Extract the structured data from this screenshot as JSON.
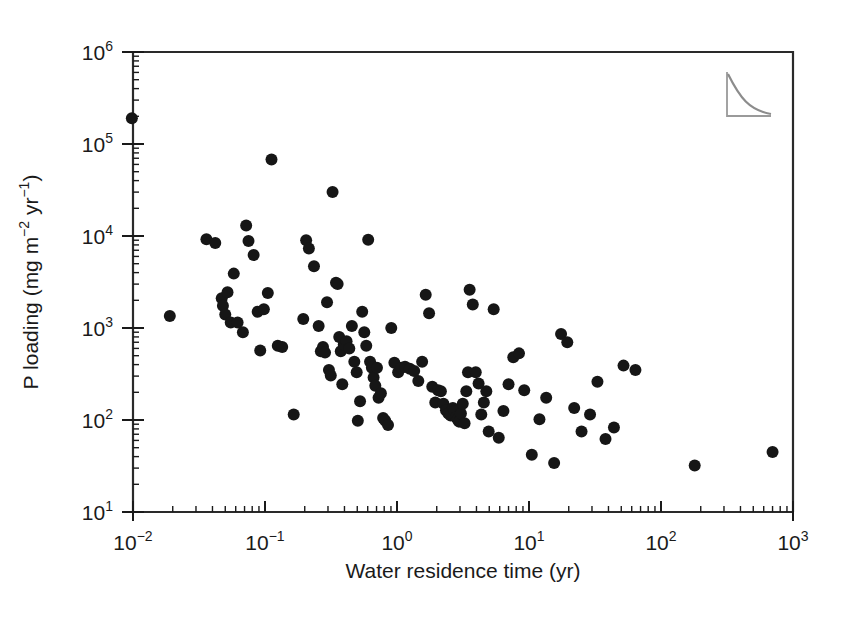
{
  "figure": {
    "background_color": "#ffffff",
    "marker_color": "#161616",
    "axis_color": "#1a1a1a",
    "inset_icon": "decay-curve-icon"
  },
  "chart_data": {
    "type": "scatter",
    "title": "",
    "xlabel": "Water residence time (yr)",
    "ylabel": "P loading (mg m−2 yr−1)",
    "ylabel_parts": {
      "prefix": "P loading (mg m",
      "sup1": "−2",
      "mid": " yr",
      "sup2": "−1",
      "suffix": ")"
    },
    "xscale": "log",
    "yscale": "log",
    "xlim": [
      0.01,
      1000
    ],
    "ylim": [
      10,
      1000000
    ],
    "grid": false,
    "legend": null,
    "xticks": [
      0.01,
      0.1,
      1,
      10,
      100,
      1000
    ],
    "xtick_labels": [
      "10−2",
      "10−1",
      "10⁰",
      "10¹",
      "10²",
      "10³"
    ],
    "xtick_bases": [
      "10",
      "10",
      "10",
      "10",
      "10",
      "10"
    ],
    "xtick_exponents": [
      "−2",
      "−1",
      "0",
      "1",
      "2",
      "3"
    ],
    "yticks": [
      10,
      100,
      1000,
      10000,
      100000,
      1000000
    ],
    "ytick_labels": [
      "10¹",
      "10²",
      "10³",
      "10⁴",
      "10⁵",
      "10⁶"
    ],
    "ytick_bases": [
      "10",
      "10",
      "10",
      "10",
      "10",
      "10"
    ],
    "ytick_exponents": [
      "1",
      "2",
      "3",
      "4",
      "5",
      "6"
    ],
    "minor_ticks": true,
    "marker": "circle-filled",
    "marker_size_px": 12,
    "n_points": 121,
    "points": [
      [
        0.0098,
        190000
      ],
      [
        0.019,
        1350
      ],
      [
        0.036,
        9200
      ],
      [
        0.042,
        8400
      ],
      [
        0.047,
        2100
      ],
      [
        0.048,
        1750
      ],
      [
        0.05,
        1400
      ],
      [
        0.052,
        2450
      ],
      [
        0.055,
        1150
      ],
      [
        0.058,
        3900
      ],
      [
        0.062,
        1150
      ],
      [
        0.068,
        900
      ],
      [
        0.072,
        13000
      ],
      [
        0.075,
        8800
      ],
      [
        0.082,
        6200
      ],
      [
        0.088,
        1500
      ],
      [
        0.092,
        570
      ],
      [
        0.098,
        1600
      ],
      [
        0.105,
        2400
      ],
      [
        0.112,
        68000
      ],
      [
        0.125,
        640
      ],
      [
        0.135,
        620
      ],
      [
        0.165,
        115
      ],
      [
        0.195,
        1250
      ],
      [
        0.205,
        9000
      ],
      [
        0.215,
        7300
      ],
      [
        0.235,
        4700
      ],
      [
        0.255,
        1050
      ],
      [
        0.265,
        560
      ],
      [
        0.275,
        620
      ],
      [
        0.285,
        540
      ],
      [
        0.295,
        1900
      ],
      [
        0.305,
        350
      ],
      [
        0.315,
        305
      ],
      [
        0.325,
        30000
      ],
      [
        0.345,
        3100
      ],
      [
        0.355,
        3000
      ],
      [
        0.365,
        800
      ],
      [
        0.375,
        560
      ],
      [
        0.385,
        245
      ],
      [
        0.395,
        660
      ],
      [
        0.415,
        720
      ],
      [
        0.435,
        600
      ],
      [
        0.455,
        1050
      ],
      [
        0.475,
        430
      ],
      [
        0.495,
        330
      ],
      [
        0.505,
        98
      ],
      [
        0.525,
        160
      ],
      [
        0.545,
        1500
      ],
      [
        0.565,
        900
      ],
      [
        0.585,
        640
      ],
      [
        0.605,
        9100
      ],
      [
        0.625,
        430
      ],
      [
        0.645,
        370
      ],
      [
        0.665,
        290
      ],
      [
        0.685,
        235
      ],
      [
        0.705,
        370
      ],
      [
        0.725,
        175
      ],
      [
        0.755,
        195
      ],
      [
        0.785,
        105
      ],
      [
        0.815,
        98
      ],
      [
        0.855,
        88
      ],
      [
        0.905,
        1000
      ],
      [
        0.955,
        420
      ],
      [
        1.02,
        330
      ],
      [
        1.08,
        370
      ],
      [
        1.15,
        380
      ],
      [
        1.25,
        360
      ],
      [
        1.35,
        340
      ],
      [
        1.45,
        265
      ],
      [
        1.55,
        430
      ],
      [
        1.65,
        2300
      ],
      [
        1.75,
        1450
      ],
      [
        1.85,
        230
      ],
      [
        1.95,
        155
      ],
      [
        2.05,
        210
      ],
      [
        2.15,
        205
      ],
      [
        2.25,
        150
      ],
      [
        2.35,
        128
      ],
      [
        2.45,
        118
      ],
      [
        2.55,
        112
      ],
      [
        2.65,
        135
      ],
      [
        2.72,
        125
      ],
      [
        2.8,
        108
      ],
      [
        2.88,
        102
      ],
      [
        2.95,
        96
      ],
      [
        3.05,
        118
      ],
      [
        3.15,
        150
      ],
      [
        3.25,
        92
      ],
      [
        3.35,
        205
      ],
      [
        3.45,
        330
      ],
      [
        3.55,
        2600
      ],
      [
        3.75,
        1800
      ],
      [
        3.95,
        330
      ],
      [
        4.15,
        250
      ],
      [
        4.35,
        115
      ],
      [
        4.55,
        155
      ],
      [
        4.75,
        205
      ],
      [
        4.95,
        75
      ],
      [
        5.4,
        1600
      ],
      [
        5.9,
        64
      ],
      [
        6.4,
        125
      ],
      [
        7.0,
        245
      ],
      [
        7.6,
        480
      ],
      [
        8.4,
        530
      ],
      [
        9.2,
        210
      ],
      [
        10.5,
        42
      ],
      [
        12.0,
        102
      ],
      [
        13.5,
        175
      ],
      [
        15.5,
        34
      ],
      [
        17.5,
        860
      ],
      [
        19.5,
        700
      ],
      [
        22.0,
        135
      ],
      [
        25.0,
        75
      ],
      [
        29.0,
        115
      ],
      [
        33.0,
        260
      ],
      [
        38.0,
        62
      ],
      [
        44.0,
        83
      ],
      [
        52.0,
        390
      ],
      [
        64.0,
        350
      ],
      [
        180.0,
        32
      ],
      [
        700.0,
        45
      ]
    ]
  }
}
